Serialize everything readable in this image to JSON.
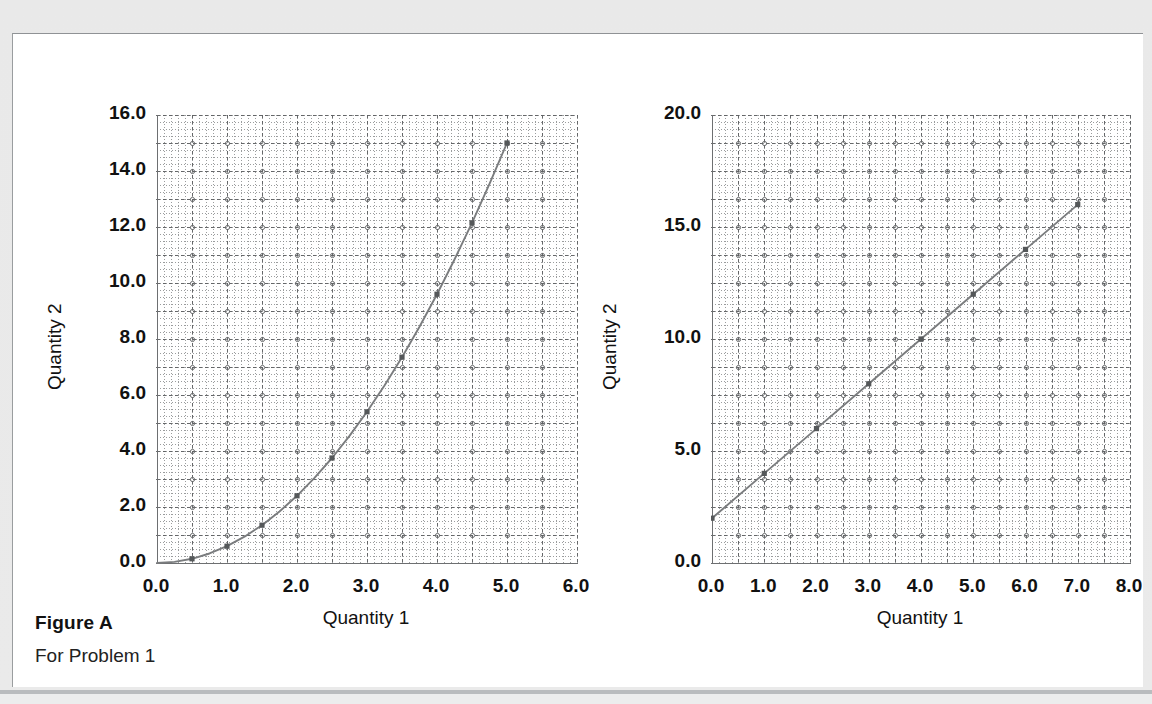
{
  "figure": {
    "caption_title": "Figure A",
    "caption_subtitle": "For Problem 1"
  },
  "style": {
    "panel_bg": "#ffffff",
    "page_bg": "#e9e9e9",
    "axis_color": "#6d6f71",
    "grid_color": "#8a8c8e",
    "curve_color": "#7a7c7e",
    "marker_color": "#55585a",
    "text_color": "#111111"
  },
  "chart_data": [
    {
      "id": "left",
      "type": "line",
      "title": "",
      "xlabel": "Quantity 1",
      "ylabel": "Quantity 2",
      "xlim": [
        0.0,
        6.0
      ],
      "ylim": [
        0.0,
        16.0
      ],
      "xticks": [
        "0.0",
        "1.0",
        "2.0",
        "3.0",
        "4.0",
        "5.0",
        "6.0"
      ],
      "xtick_values": [
        0.0,
        1.0,
        2.0,
        3.0,
        4.0,
        5.0,
        6.0
      ],
      "yticks": [
        "0.0",
        "2.0",
        "4.0",
        "6.0",
        "8.0",
        "10.0",
        "12.0",
        "14.0",
        "16.0"
      ],
      "ytick_values": [
        0.0,
        2.0,
        4.0,
        6.0,
        8.0,
        10.0,
        12.0,
        14.0,
        16.0
      ],
      "grid": true,
      "grid_minor_x": 0.1,
      "grid_minor_y": 0.25,
      "grid_major_x": 0.5,
      "grid_major_y": 1.0,
      "legend": null,
      "x": [
        0.0,
        0.25,
        0.5,
        0.75,
        1.0,
        1.25,
        1.5,
        1.75,
        2.0,
        2.25,
        2.5,
        2.75,
        3.0,
        3.25,
        3.5,
        3.75,
        4.0,
        4.25,
        4.5,
        4.75,
        5.0
      ],
      "y": [
        0.0,
        0.04,
        0.15,
        0.34,
        0.6,
        0.94,
        1.35,
        1.84,
        2.4,
        3.04,
        3.75,
        4.54,
        5.4,
        6.34,
        7.35,
        8.44,
        9.6,
        10.84,
        12.15,
        13.54,
        15.0
      ],
      "relation": "y = 0.6 * x^2",
      "markers_at_x": [
        0.5,
        1.0,
        1.5,
        2.0,
        2.5,
        3.0,
        3.5,
        4.0,
        4.5,
        5.0
      ],
      "marker_shape": "square"
    },
    {
      "id": "right",
      "type": "line",
      "title": "",
      "xlabel": "Quantity 1",
      "ylabel": "Quantity 2",
      "xlim": [
        0.0,
        8.0
      ],
      "ylim": [
        0.0,
        20.0
      ],
      "xticks": [
        "0.0",
        "1.0",
        "2.0",
        "3.0",
        "4.0",
        "5.0",
        "6.0",
        "7.0",
        "8.0"
      ],
      "xtick_values": [
        0.0,
        1.0,
        2.0,
        3.0,
        4.0,
        5.0,
        6.0,
        7.0,
        8.0
      ],
      "yticks": [
        "0.0",
        "5.0",
        "10.0",
        "15.0",
        "20.0"
      ],
      "ytick_values": [
        0.0,
        5.0,
        10.0,
        15.0,
        20.0
      ],
      "grid": true,
      "grid_minor_x": 0.125,
      "grid_minor_y": 0.3125,
      "grid_major_x": 0.5,
      "grid_major_y": 1.25,
      "legend": null,
      "x": [
        0.0,
        1.0,
        2.0,
        3.0,
        4.0,
        5.0,
        6.0,
        7.0
      ],
      "y": [
        2.0,
        4.0,
        6.0,
        8.0,
        10.0,
        12.0,
        14.0,
        16.0
      ],
      "relation": "y = 2 + 2x",
      "markers_at_x": [
        0.0,
        1.0,
        2.0,
        3.0,
        4.0,
        5.0,
        6.0,
        7.0
      ],
      "marker_shape": "square"
    }
  ]
}
